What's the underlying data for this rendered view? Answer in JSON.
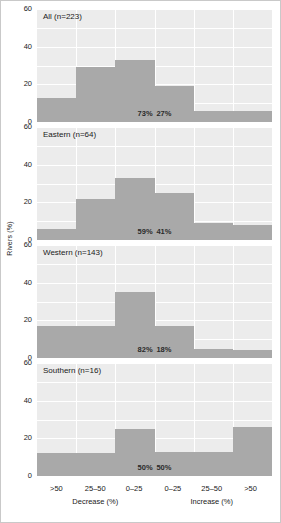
{
  "chart_data": {
    "type": "bar",
    "title": "",
    "xlabel": "",
    "ylabel": "Rivers (%)",
    "ylim": [
      0,
      60
    ],
    "yticks": [
      0,
      20,
      40,
      60
    ],
    "grid": true,
    "legend": "none",
    "categories": [
      ">50",
      "25–50",
      "0–25",
      "0–25",
      "25–50",
      ">50"
    ],
    "group_labels": [
      "Decrease (%)",
      "Increase (%)"
    ],
    "panels": [
      {
        "title": "All (n=223)",
        "n": 223,
        "values": [
          13,
          29,
          33,
          19,
          6,
          6
        ],
        "pct_decrease": "73%",
        "pct_increase": "27%"
      },
      {
        "title": "Eastern (n=64)",
        "n": 64,
        "values": [
          6,
          22,
          33,
          25,
          9,
          8
        ],
        "pct_decrease": "59%",
        "pct_increase": "41%"
      },
      {
        "title": "Western (n=143)",
        "n": 143,
        "values": [
          17,
          17,
          35,
          17,
          5,
          4
        ],
        "pct_decrease": "82%",
        "pct_increase": "18%"
      },
      {
        "title": "Southern (n=16)",
        "n": 16,
        "values": [
          12,
          12,
          25,
          13,
          13,
          26
        ],
        "pct_decrease": "50%",
        "pct_increase": "50%"
      }
    ],
    "colors": {
      "bar": "#a9a9a9",
      "plot_background": "#ececec",
      "gridline": "#ffffff",
      "text": "#1a1a1a",
      "frame": "#c9c9c9"
    }
  }
}
